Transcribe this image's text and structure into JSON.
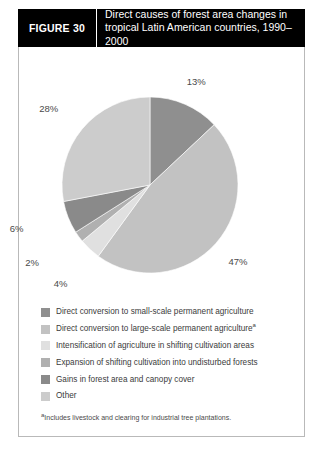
{
  "figure": {
    "number_label": "FIGURE 30",
    "title": "Direct causes of forest area changes in tropical Latin American countries, 1990–2000",
    "title_line1": "Direct causes of forest area changes in",
    "title_line2": "tropical Latin American countries, 1990–2000"
  },
  "footnote": {
    "marker": "a",
    "text": "Includes livestock and clearing for industrial tree plantations."
  },
  "chart_data": {
    "type": "pie",
    "title": "Direct causes of forest area changes in tropical Latin American countries, 1990–2000",
    "xlabel": "",
    "ylabel": "",
    "grid": false,
    "legend_position": "bottom",
    "units": "percent",
    "start_angle_deg": 0,
    "direction": "clockwise",
    "categories": [
      "Direct conversion to small-scale permanent agriculture",
      "Direct conversion to large-scale permanent agriculture",
      "Intensification of agriculture in shifting cultivation areas",
      "Expansion of shifting cultivation into undisturbed forests",
      "Gains in forest area and canopy cover",
      "Other"
    ],
    "values": [
      13,
      47,
      4,
      2,
      6,
      28
    ],
    "data_labels": [
      "13%",
      "47%",
      "4%",
      "2%",
      "6%",
      "28%"
    ],
    "colors": [
      "#8f8f8f",
      "#c2c2c2",
      "#e0e0e0",
      "#b0b0b0",
      "#8a8a8a",
      "#cccccc"
    ],
    "slices": [
      {
        "label": "Direct conversion to small-scale permanent agriculture",
        "value": 13,
        "data_label": "13%",
        "color": "#8f8f8f",
        "footnote": false
      },
      {
        "label": "Direct conversion to large-scale permanent agriculture",
        "value": 47,
        "data_label": "47%",
        "color": "#c2c2c2",
        "footnote": true
      },
      {
        "label": "Intensification of agriculture in shifting cultivation areas",
        "value": 4,
        "data_label": "4%",
        "color": "#e0e0e0",
        "footnote": false
      },
      {
        "label": "Expansion of shifting cultivation into undisturbed forests",
        "value": 2,
        "data_label": "2%",
        "color": "#b0b0b0",
        "footnote": false
      },
      {
        "label": "Gains in forest area and canopy cover",
        "value": 6,
        "data_label": "6%",
        "color": "#8a8a8a",
        "footnote": false
      },
      {
        "label": "Other",
        "value": 28,
        "data_label": "28%",
        "color": "#cccccc",
        "footnote": false
      }
    ]
  },
  "legend": {
    "items": [
      {
        "label": "Direct conversion to small-scale permanent agriculture",
        "color": "#8f8f8f",
        "footnote_marker": ""
      },
      {
        "label": "Direct conversion to large-scale permanent agriculture",
        "color": "#c2c2c2",
        "footnote_marker": "a"
      },
      {
        "label": "Intensification of agriculture in shifting cultivation areas",
        "color": "#e0e0e0",
        "footnote_marker": ""
      },
      {
        "label": "Expansion of shifting cultivation into undisturbed forests",
        "color": "#b0b0b0",
        "footnote_marker": ""
      },
      {
        "label": "Gains in forest area and canopy cover",
        "color": "#8a8a8a",
        "footnote_marker": ""
      },
      {
        "label": "Other",
        "color": "#cccccc",
        "footnote_marker": ""
      }
    ]
  }
}
